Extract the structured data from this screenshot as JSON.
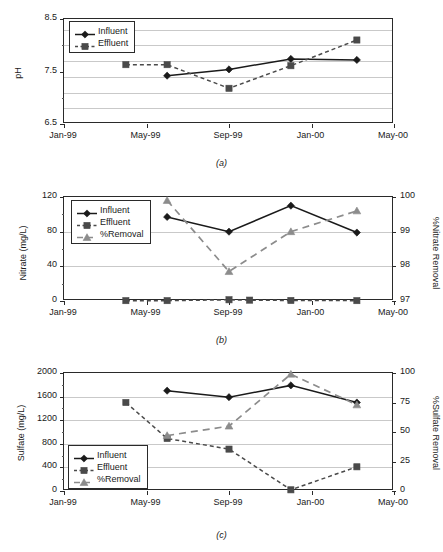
{
  "figure": {
    "panels": [
      "a",
      "b",
      "c"
    ],
    "colors": {
      "influent": "#1a1a1a",
      "effluent": "#4a4a4a",
      "removal": "#8c8c8c",
      "grid": "#c9c9c9",
      "axis": "#2a2a2a"
    }
  },
  "captions": {
    "a": "(a)",
    "b": "(b)",
    "c": "(c)"
  },
  "legend_labels": {
    "influent": "Influent",
    "effluent": "Effluent",
    "removal": "%Removal"
  },
  "xaxis": {
    "ticks": [
      "Jan-99",
      "May-99",
      "Sep-99",
      "Jan-00",
      "May-00"
    ],
    "tick_values": [
      0,
      4,
      8,
      12,
      16
    ],
    "xlim": [
      0,
      16
    ]
  },
  "chart_data": [
    {
      "id": "a",
      "type": "line",
      "title": "",
      "xlabel": "",
      "ylabel": "pH",
      "ylim": [
        6.5,
        8.5
      ],
      "yticks": [
        6.5,
        7.5,
        8.5
      ],
      "ytick_labels": [
        "6.5",
        "7.5",
        "8.5"
      ],
      "ygrid": [
        6.8,
        7.1,
        7.4,
        7.7,
        8.0,
        8.3
      ],
      "grid": true,
      "legend_position": "top-left",
      "x": [
        3,
        5,
        8,
        11,
        14.2
      ],
      "xtick_labels": [
        "Jan-99",
        "May-99",
        "Sep-99",
        "Jan-00",
        "May-00"
      ],
      "series": [
        {
          "name": "Influent",
          "marker": "diamond",
          "dash": "solid",
          "x": [
            5,
            8,
            11,
            14.2
          ],
          "values": [
            7.42,
            7.54,
            7.74,
            7.72
          ]
        },
        {
          "name": "Effluent",
          "marker": "square",
          "dash": "dashed",
          "x": [
            3,
            5,
            8,
            11,
            14.2
          ],
          "values": [
            7.63,
            7.63,
            7.18,
            7.61,
            8.1
          ]
        }
      ]
    },
    {
      "id": "b",
      "type": "line",
      "title": "",
      "xlabel": "",
      "ylabel": "Nitrate (mg/L)",
      "ylabel_right": "%Nitrate Removal",
      "ylim": [
        0,
        120
      ],
      "yticks": [
        0,
        40,
        80,
        120
      ],
      "ytick_labels": [
        "0",
        "40",
        "80",
        "120"
      ],
      "ylim_right": [
        97,
        100
      ],
      "yticks_right": [
        97,
        98,
        99,
        100
      ],
      "ytick_labels_right": [
        "97",
        "98",
        "99",
        "100"
      ],
      "grid": true,
      "legend_position": "top-left",
      "series": [
        {
          "name": "Influent",
          "marker": "diamond",
          "dash": "solid",
          "axis": "left",
          "x": [
            5,
            8,
            11,
            14.2
          ],
          "values": [
            97,
            80,
            110,
            79
          ]
        },
        {
          "name": "Effluent",
          "marker": "square",
          "dash": "dashed",
          "axis": "left",
          "x": [
            3,
            5,
            8,
            9,
            11,
            14.2
          ],
          "values": [
            0.4,
            0.4,
            1.4,
            1.0,
            0.6,
            0.4
          ]
        },
        {
          "name": "%Removal",
          "marker": "triangle",
          "dash": "dashed",
          "axis": "right",
          "x": [
            5,
            8,
            11,
            14.2
          ],
          "values": [
            99.9,
            97.85,
            99.0,
            99.6
          ]
        }
      ]
    },
    {
      "id": "c",
      "type": "line",
      "title": "",
      "xlabel": "",
      "ylabel": "Sulfate (mg/L)",
      "ylabel_right": "%Sulfate Removal",
      "ylim": [
        0,
        2000
      ],
      "yticks": [
        0,
        400,
        800,
        1200,
        1600,
        2000
      ],
      "ytick_labels": [
        "0",
        "400",
        "800",
        "1200",
        "1600",
        "2000"
      ],
      "ylim_right": [
        0,
        100
      ],
      "yticks_right": [
        0,
        25,
        50,
        75,
        100
      ],
      "ytick_labels_right": [
        "0",
        "25",
        "50",
        "75",
        "100"
      ],
      "grid": true,
      "legend_position": "bottom-left",
      "series": [
        {
          "name": "Influent",
          "marker": "diamond",
          "dash": "solid",
          "axis": "left",
          "x": [
            5,
            8,
            11,
            14.2
          ],
          "values": [
            1700,
            1590,
            1790,
            1500
          ]
        },
        {
          "name": "Effluent",
          "marker": "square",
          "dash": "dashed",
          "axis": "left",
          "x": [
            3,
            5,
            8,
            11,
            14.2
          ],
          "values": [
            1500,
            890,
            710,
            20,
            410
          ]
        },
        {
          "name": "%Removal",
          "marker": "triangle",
          "dash": "dashed",
          "axis": "right",
          "x": [
            5,
            8,
            11,
            14.2
          ],
          "values": [
            47,
            55,
            99,
            73
          ]
        }
      ]
    }
  ]
}
